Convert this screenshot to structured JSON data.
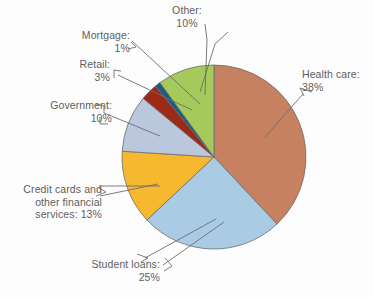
{
  "chart_data": {
    "type": "pie",
    "title": "",
    "subtitle": "",
    "xlabel": "",
    "ylabel": "",
    "legend_position": "none",
    "grid": false,
    "units": "percent",
    "total": 100,
    "categories": [
      "Health care",
      "Student loans",
      "Credit cards and other financial services",
      "Government",
      "Retail",
      "Mortgage",
      "Other"
    ],
    "values": [
      38,
      25,
      13,
      10,
      3,
      1,
      10
    ],
    "slices": [
      {
        "name": "Health care",
        "value": 38,
        "label_text": "Health care:\n38%",
        "label_value": "38%",
        "color": "#c58160",
        "start_deg": 0,
        "end_deg": 136.8,
        "label_align": "left"
      },
      {
        "name": "Student loans",
        "value": 25,
        "label_text": "Student loans:\n25%",
        "label_value": "25%",
        "color": "#a9cce4",
        "start_deg": 136.8,
        "end_deg": 226.8,
        "label_align": "right"
      },
      {
        "name": "Credit cards and other financial services",
        "value": 13,
        "label_text": "Credit cards and\nother financial\nservices: 13%",
        "label_value": "13%",
        "color": "#f6b82e",
        "start_deg": 226.8,
        "end_deg": 273.6,
        "label_align": "right"
      },
      {
        "name": "Government",
        "value": 10,
        "label_text": "Government:\n10%",
        "label_value": "10%",
        "color": "#bac7dd",
        "start_deg": 273.6,
        "end_deg": 309.6,
        "label_align": "right"
      },
      {
        "name": "Retail",
        "value": 3,
        "label_text": "Retail:\n3%",
        "label_value": "3%",
        "color": "#9c2a17",
        "start_deg": 309.6,
        "end_deg": 320.4,
        "label_align": "right"
      },
      {
        "name": "Mortgage",
        "value": 1,
        "label_text": "Mortgage:\n1%",
        "label_value": "1%",
        "color": "#1d5a82",
        "start_deg": 320.4,
        "end_deg": 324.0,
        "label_align": "right"
      },
      {
        "name": "Other",
        "value": 10,
        "label_text": "Other:\n10%",
        "label_value": "10%",
        "color": "#a6c95c",
        "start_deg": 324.0,
        "end_deg": 360.0,
        "label_align": "center"
      }
    ]
  },
  "labels": {
    "other": "Other:\n10%",
    "mortgage": "Mortgage:\n1%",
    "retail": "Retail:\n3%",
    "government": "Government:\n10%",
    "credit_cards": "Credit cards and\nother financial\nservices: 13%",
    "student_loans": "Student loans:\n25%",
    "health_care": "Health care:\n38%"
  },
  "style": {
    "background": "#fdfdfd",
    "text_color": "#5e5e5e",
    "slice_outline": "#6d6d6d",
    "leader_line": "#6d6d6d"
  },
  "geometry": {
    "center_x": 214,
    "center_y": 157,
    "radius": 92
  }
}
